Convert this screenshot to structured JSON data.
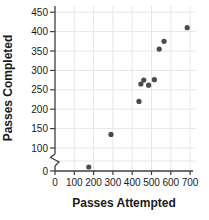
{
  "chart_data": {
    "type": "scatter",
    "title": "",
    "xlabel": "Passes Attempted",
    "ylabel": "Passes Completed",
    "xlim": [
      0,
      700
    ],
    "ylim": [
      0,
      450
    ],
    "x_ticks": [
      0,
      100,
      200,
      300,
      400,
      500,
      600,
      700
    ],
    "y_ticks": [
      0,
      100,
      150,
      200,
      250,
      300,
      350,
      400,
      450
    ],
    "y_gridlines": [
      50,
      100,
      150,
      200,
      250,
      300,
      350,
      400,
      450
    ],
    "axis_break": {
      "axis": "y",
      "between": [
        0,
        100
      ]
    },
    "grid": true,
    "legend": "none",
    "points": [
      {
        "x": 175,
        "y": 20
      },
      {
        "x": 290,
        "y": 135
      },
      {
        "x": 435,
        "y": 220
      },
      {
        "x": 445,
        "y": 265
      },
      {
        "x": 460,
        "y": 275
      },
      {
        "x": 485,
        "y": 262
      },
      {
        "x": 515,
        "y": 276
      },
      {
        "x": 540,
        "y": 355
      },
      {
        "x": 565,
        "y": 375
      },
      {
        "x": 685,
        "y": 410
      }
    ],
    "colors": {
      "point": "#4b4b4b",
      "grid": "#e8e5e5",
      "axis": "#3f3f3f",
      "text": "#1a1a1a"
    }
  }
}
